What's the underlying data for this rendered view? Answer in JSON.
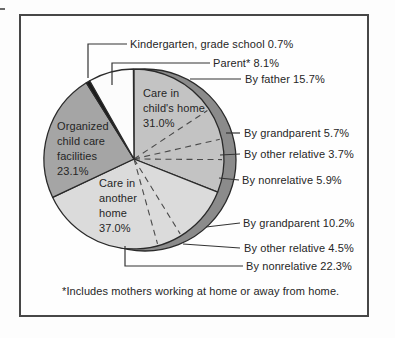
{
  "figure": {
    "footnote": "*Includes mothers working at home or away from home."
  },
  "chart_data": {
    "type": "pie",
    "title": "",
    "start_angle_deg": 0,
    "direction": "clockwise",
    "units": "percent",
    "rim_color": "#8b8b8b",
    "outline_color": "#2a2a2a",
    "divider_color": "#4a4a4a",
    "leader_color": "#333333",
    "slices": [
      {
        "label": "Care in child's home",
        "value": 31.0,
        "color": "#c3c3c3",
        "subdivisions": [
          {
            "label": "By father",
            "value": 15.7
          },
          {
            "label": "By grandparent",
            "value": 5.7
          },
          {
            "label": "By other relative",
            "value": 3.7
          },
          {
            "label": "By nonrelative",
            "value": 5.9
          }
        ]
      },
      {
        "label": "Care in another home",
        "value": 37.0,
        "color": "#dbdbdb",
        "subdivisions": [
          {
            "label": "By grandparent",
            "value": 10.2
          },
          {
            "label": "By other relative",
            "value": 4.5
          },
          {
            "label": "By nonrelative",
            "value": 22.3
          }
        ]
      },
      {
        "label": "Organized child care facilities",
        "value": 23.1,
        "color": "#a5a5a5"
      },
      {
        "label": "Kindergarten, grade school",
        "value": 0.7,
        "color": "#1b1b1b"
      },
      {
        "label": "Parent*",
        "value": 8.1,
        "color": "#fcfcfc"
      }
    ],
    "callouts": [
      {
        "text": "Kindergarten, grade school 0.7%"
      },
      {
        "text": "Parent* 8.1%"
      },
      {
        "text": "By father 15.7%"
      },
      {
        "text": "By grandparent 5.7%"
      },
      {
        "text": "By other relative 3.7%"
      },
      {
        "text": "By nonrelative 5.9%"
      },
      {
        "text": "By grandparent 10.2%"
      },
      {
        "text": "By other relative 4.5%"
      },
      {
        "text": "By nonrelative 22.3%"
      }
    ],
    "inner_labels": [
      {
        "lines": [
          "Care in",
          "child's home",
          "31.0%"
        ]
      },
      {
        "lines": [
          "Organized",
          "child care",
          "facilities",
          "23.1%"
        ]
      },
      {
        "lines": [
          "Care in",
          "another",
          "home",
          "37.0%"
        ]
      }
    ]
  }
}
